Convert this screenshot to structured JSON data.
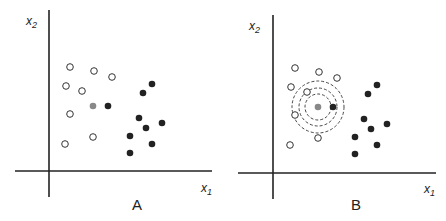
{
  "panels": [
    {
      "label": "A",
      "x_axis_label": "x",
      "x_axis_sub": "1",
      "y_axis_label": "x",
      "y_axis_sub": "2"
    },
    {
      "label": "B",
      "x_axis_label": "x",
      "x_axis_sub": "1",
      "y_axis_label": "x",
      "y_axis_sub": "2"
    }
  ],
  "points": {
    "open": [
      [
        70,
        67
      ],
      [
        94,
        71
      ],
      [
        112,
        77
      ],
      [
        66,
        86
      ],
      [
        82,
        91
      ],
      [
        70,
        114
      ],
      [
        93,
        137
      ],
      [
        65,
        144
      ]
    ],
    "query": [
      93,
      106
    ],
    "filled": [
      [
        108,
        106
      ],
      [
        152,
        84
      ],
      [
        143,
        93
      ],
      [
        139,
        118
      ],
      [
        162,
        123
      ],
      [
        146,
        128
      ],
      [
        130,
        136
      ],
      [
        152,
        144
      ],
      [
        130,
        153
      ]
    ]
  },
  "rings_radii": [
    13,
    19,
    26
  ],
  "colors": {
    "open_fill": "#ffffff",
    "filled": "#222222",
    "query": "#888888",
    "axis": "#222222"
  }
}
